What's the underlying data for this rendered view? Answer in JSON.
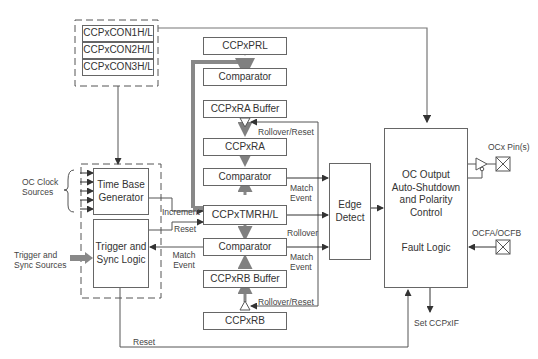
{
  "diagram": {
    "config_registers": [
      "CCPxCON1H/L",
      "CCPxCON2H/L",
      "CCPxCON3H/L"
    ],
    "blocks": {
      "prl": "CCPxPRL",
      "comparator_top": "Comparator",
      "ra_buffer": "CCPxRA Buffer",
      "ra": "CCPxRA",
      "comparator_a": "Comparator",
      "tmr": "CCPxTMRH/L",
      "comparator_b": "Comparator",
      "rb_buffer": "CCPxRB Buffer",
      "rb": "CCPxRB",
      "time_base": "Time Base Generator",
      "trigger_sync": "Trigger and Sync Logic",
      "edge_detect": "Edge Detect",
      "oc_output": "OC Output Auto-Shutdown and Polarity Control",
      "fault_logic": "Fault Logic"
    },
    "labels": {
      "oc_clock_sources": "OC Clock Sources",
      "trigger_sources": "Trigger and Sync Sources",
      "increment": "Increment",
      "reset": "Reset",
      "match_event_left": "Match Event",
      "rollover_reset_a": "Rollover/Reset",
      "rollover_reset_b": "Rollover/Reset",
      "match_event_a": "Match Event",
      "rollover": "Rollover",
      "match_event_b": "Match Event",
      "ocx_pins": "OCx Pin(s)",
      "ocfa_ocfb": "OCFA/OCFB",
      "set_ccpxif": "Set CCPxIF",
      "reset_bottom": "Reset"
    },
    "colors": {
      "line": "#555555",
      "thick_bus": "#808080",
      "box_border": "#666666"
    }
  }
}
